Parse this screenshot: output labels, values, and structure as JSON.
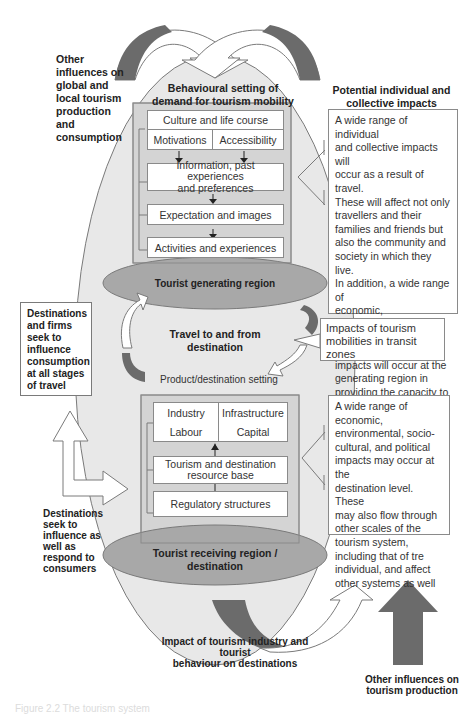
{
  "diagram": {
    "top_left_label": "Other\ninfluences on\nglobal and\nlocal tourism\nproduction\nand\nconsumption",
    "generating": {
      "heading": "Behavioural setting of\ndemand for tourism mobility",
      "boxes": {
        "culture": "Culture and life course",
        "motivations": "Motivations",
        "accessibility": "Accessibility",
        "information": "Information, past experiences\nand preferences",
        "expectation": "Expectation and images",
        "activities": "Activities and experiences"
      },
      "region_label": "Tourist generating region"
    },
    "potential_impacts": {
      "heading": "Potential individual and\ncollective impacts",
      "text": "A wide range of individual\nand collective impacts will\noccur as a result of travel.\nThese will affect not only\ntravellers and their\nfamilies and friends but\nalso the community and\nsociety in which they live.\nIn addition, a wide range of\neconomic, environmental,\nsocio-cultural and political\nimpacts will occur at the\ngenerating region in\nproviding the capacity to\ntravel"
    },
    "destinations_firms": "Destinations\nand firms\nseek to\ninfluence\nconsumption\nat all stages\nof travel",
    "travel_label": "Travel to and from\ndestination",
    "transit_impacts": "Impacts of tourism\nmobilities in transit zones",
    "product_setting": "Product/destination setting",
    "receiving": {
      "boxes": {
        "industry": "Industry",
        "infrastructure": "Infrastructure",
        "labour": "Labour",
        "capital": "Capital",
        "resource_base": "Tourism and destination\nresource base",
        "regulatory": "Regulatory structures"
      },
      "region_label": "Tourist receiving region /\ndestination"
    },
    "destination_impacts": "A wide range of\neconomic,\nenvironmental, socio-\ncultural, and political\nimpacts may occur at the\ndestination level. These\nmay also flow through\nother scales of the\ntourism system,\nincluding that of tre\nindividual, and affect\nother systems as well",
    "destinations_influence": "Destinations\nseek to\ninfluence as\nwell as\nrespond to\nconsumers",
    "impact_industry": "Impact of tourism industry and tourist\nbehaviour on destinations",
    "other_production": "Other influences on\ntourism production",
    "caption": "Figure 2.2  The tourism system"
  },
  "colors": {
    "big_oval": "#e6e6e6",
    "region_oval": "#a8a8a8",
    "panel": "#d4d4d4",
    "dark_arrow": "#6b6b6b",
    "stroke": "#7a7a7a"
  }
}
